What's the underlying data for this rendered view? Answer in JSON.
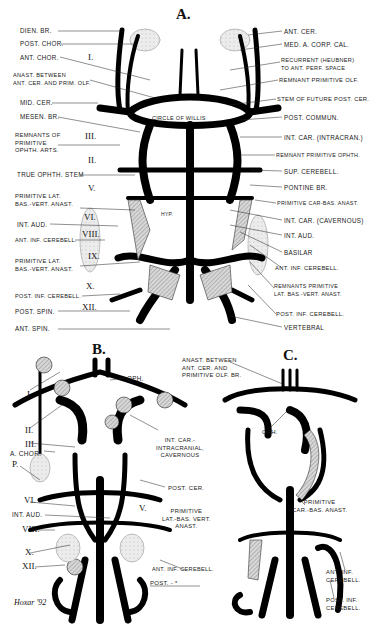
{
  "figure": {
    "panels": {
      "a": "A.",
      "b": "B.",
      "c": "C."
    },
    "panel_a": {
      "left_labels": [
        "Dien. br.",
        "Post. chor.",
        "Ant. chor.",
        "Anast. between\nant. cer. and prim. olf.",
        "Mid. cer.",
        "Mesen. br.",
        "Remnants of\nprimitive\nophth. arts.",
        "True ophth. stem",
        "Primitive lat.\nbas.-vert. anast.",
        "Int. aud.",
        "Ant. inf. cerebell.",
        "Primitive lat.\nbas.-vert. anast.",
        "Post. inf. cerebell.",
        "Post. spin.",
        "Ant. spin."
      ],
      "right_labels": [
        "Ant. cer.",
        "Med. a. corp. cal.",
        "Recurrent (Heubner)\nto ant. perf. space",
        "Remnant primitive olf.",
        "Stem of future post. cer.",
        "Post. commun.",
        "Int. car. (intracran.)",
        "Remnant primitive ophth.",
        "Sup. cerebell.",
        "Pontine br.",
        "Primitive car-bas. anast.",
        "Int. car. (cavernous)",
        "Int. aud.",
        "Basilar",
        "Ant. inf. cerebell.",
        "Remnants primitive\nlat. bas.-vert. anast.",
        "Post. inf. cerebell.",
        "Vertebral"
      ],
      "center_labels": {
        "circle": "Circle of Willis",
        "hyp": "Hyp."
      },
      "nerve_numerals": [
        "I.",
        "III.",
        "II.",
        "V.",
        "VI.",
        "VIII.",
        "IX.",
        "X.",
        "XII."
      ]
    },
    "panel_b": {
      "left_labels": [
        "I.",
        "II.",
        "III.",
        "A. chor.",
        "P.",
        "VI.",
        "Int. aud.",
        "VIII.",
        "X.",
        "XII."
      ],
      "right_labels": [
        "Oph.",
        "Int. car.-\nintracranial,\ncavernous",
        "Post. cer.",
        "V.",
        "Primitive\nlat.-bas. vert.\nanast.",
        "Ant. inf. cerebell.",
        "Post. - *"
      ]
    },
    "panel_c": {
      "labels": [
        "Anast. between\nant. cer. and\nprimitive olf. br.",
        "Oph.",
        "Primitive\ncar.-bas. anast.",
        "Ant. inf.\ncerebell.",
        "Post. inf.\ncerebell."
      ]
    },
    "signature": "Hoxar '92"
  }
}
